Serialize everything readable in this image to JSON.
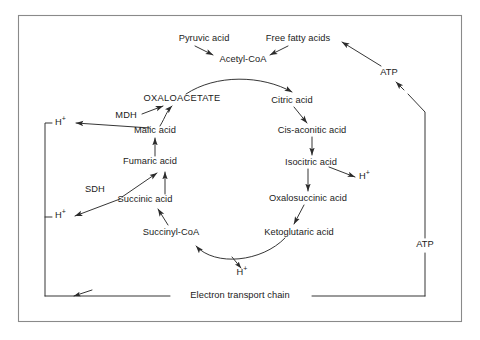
{
  "diagram": {
    "frame_color": "#8a8a8a",
    "line_color": "#2b2b2b",
    "text_color": "#1b1b1b",
    "background": "#ffffff",
    "nodes": [
      {
        "id": "pyruvic_acid",
        "label": "Pyruvic acid",
        "x": 204,
        "y": 40
      },
      {
        "id": "free_fatty_acids",
        "label": "Free fatty acids",
        "x": 298,
        "y": 40
      },
      {
        "id": "acetyl_coa",
        "label": "Acetyl-CoA",
        "x": 243,
        "y": 60
      },
      {
        "id": "atp_top",
        "label": "ATP",
        "x": 389,
        "y": 73
      },
      {
        "id": "oxaloacetate",
        "label": "OXALOACETATE",
        "x": 182,
        "y": 100
      },
      {
        "id": "citric_acid",
        "label": "Citric acid",
        "x": 292,
        "y": 101
      },
      {
        "id": "mdh",
        "label": "MDH",
        "x": 126,
        "y": 117
      },
      {
        "id": "h_plus_upper_left",
        "label": "H+",
        "x": 60,
        "y": 124
      },
      {
        "id": "malic_acid",
        "label": "Malic acid",
        "x": 155,
        "y": 131
      },
      {
        "id": "cis_aconitic_acid",
        "label": "Cis-aconitic acid",
        "x": 312,
        "y": 131
      },
      {
        "id": "fumaric_acid",
        "label": "Fumaric acid",
        "x": 150,
        "y": 162
      },
      {
        "id": "isocitric_acid",
        "label": "Isocitric acid",
        "x": 311,
        "y": 163
      },
      {
        "id": "h_plus_isocitric",
        "label": "H+",
        "x": 364,
        "y": 178
      },
      {
        "id": "sdh",
        "label": "SDH",
        "x": 95,
        "y": 190
      },
      {
        "id": "oxalosuccinic_acid",
        "label": "Oxalosuccinic acid",
        "x": 308,
        "y": 199
      },
      {
        "id": "succinic_acid",
        "label": "Succinic acid",
        "x": 145,
        "y": 200
      },
      {
        "id": "h_plus_lower_left",
        "label": "H+",
        "x": 60,
        "y": 217
      },
      {
        "id": "ketoglutaric_acid",
        "label": "Ketoglutaric acid",
        "x": 299,
        "y": 233
      },
      {
        "id": "succinyl_coa",
        "label": "Succinyl-CoA",
        "x": 171,
        "y": 233
      },
      {
        "id": "h_plus_bottom",
        "label": "H+",
        "x": 242,
        "y": 274
      },
      {
        "id": "electron_transport",
        "label": "Electron transport chain",
        "x": 240,
        "y": 296
      },
      {
        "id": "atp_right",
        "label": "ATP",
        "x": 425,
        "y": 245
      }
    ],
    "edges": [
      {
        "from": "pyruvic_acid",
        "to": "acetyl_coa"
      },
      {
        "from": "free_fatty_acids",
        "to": "acetyl_coa"
      },
      {
        "from": "acetyl_coa",
        "to": "citric_acid"
      },
      {
        "from": "citric_acid",
        "to": "cis_aconitic_acid"
      },
      {
        "from": "cis_aconitic_acid",
        "to": "isocitric_acid"
      },
      {
        "from": "isocitric_acid",
        "to": "oxalosuccinic_acid"
      },
      {
        "from": "isocitric_acid",
        "to": "h_plus_isocitric"
      },
      {
        "from": "oxalosuccinic_acid",
        "to": "ketoglutaric_acid"
      },
      {
        "from": "ketoglutaric_acid",
        "to": "succinyl_coa"
      },
      {
        "from": "ketoglutaric_acid",
        "to": "h_plus_bottom"
      },
      {
        "from": "succinyl_coa",
        "to": "succinic_acid"
      },
      {
        "from": "succinic_acid",
        "to": "fumaric_acid"
      },
      {
        "from": "succinic_acid",
        "to": "h_plus_lower_left"
      },
      {
        "from": "fumaric_acid",
        "to": "malic_acid"
      },
      {
        "from": "malic_acid",
        "to": "oxaloacetate"
      },
      {
        "from": "malic_acid",
        "to": "h_plus_upper_left"
      },
      {
        "from": "electron_transport",
        "to": "atp_right"
      },
      {
        "from": "atp_right",
        "to": "atp_top"
      },
      {
        "from": "atp_top",
        "to": "free_fatty_acids"
      }
    ]
  }
}
